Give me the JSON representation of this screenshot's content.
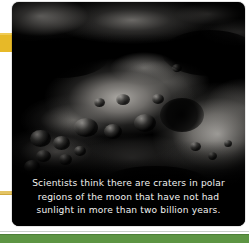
{
  "page": {
    "background_color": "#ffffff",
    "width": 249,
    "height": 243
  },
  "tabs": {
    "primary": {
      "name": "index-tab-gold",
      "color": "#e7b928"
    },
    "secondary": {
      "name": "index-tab-thin",
      "color": "#e4c464"
    }
  },
  "photo": {
    "subject": "moon-surface-craters",
    "background_color": "#000000",
    "caption": {
      "lines": [
        "Scientists think there are craters in polar",
        "regions of the moon that have not had",
        "sunlight in more than two billion years."
      ],
      "full_text": "Scientists think there are craters in polar regions of the moon that have not had sunlight in more than two billion years.",
      "text_color": "#f2f2f0"
    }
  },
  "footer": {
    "band_color": "#5d9543",
    "hairline_color": "#9aa79a"
  }
}
